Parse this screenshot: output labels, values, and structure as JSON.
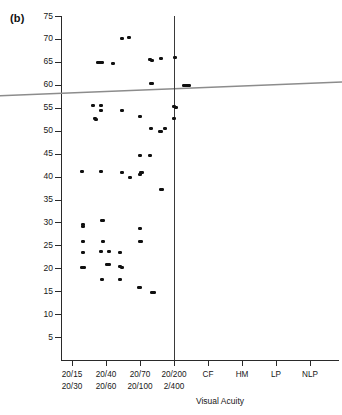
{
  "figure": {
    "panel_label": "(b)"
  },
  "chart_data": {
    "type": "scatter",
    "title": "",
    "xlabel": "Visual Acuity",
    "ylabel": "",
    "ylim": [
      0,
      75
    ],
    "yticks": [
      5,
      10,
      15,
      20,
      25,
      30,
      35,
      40,
      45,
      50,
      55,
      60,
      65,
      70,
      75
    ],
    "ytick_labels": [
      "5",
      "10",
      "15",
      "20",
      "25",
      "30",
      "35",
      "40",
      "45",
      "50",
      "55",
      "60",
      "65",
      "70",
      "75"
    ],
    "grid": false,
    "legend": null,
    "xtick_groups": [
      {
        "index": 0,
        "line1": "20/15",
        "line2": "20/30"
      },
      {
        "index": 1,
        "line1": "20/40",
        "line2": "20/60"
      },
      {
        "index": 2,
        "line1": "20/70",
        "line2": "20/100"
      },
      {
        "index": 3,
        "line1": "20/200",
        "line2": "2/400"
      }
    ],
    "xtick_singles": [
      {
        "index": 4,
        "label": "CF"
      },
      {
        "index": 5,
        "label": "HM"
      },
      {
        "index": 6,
        "label": "LP"
      },
      {
        "index": 7,
        "label": "NLP"
      }
    ],
    "reference_line": {
      "kind": "regression",
      "color": "#8c8c8c",
      "y_at_left_edge": 57.6,
      "y_at_right_edge": 60.6
    },
    "divider_line": {
      "kind": "vertical-divider",
      "color": "#3a3a3a",
      "x_category": "20/200 - 2/400"
    },
    "points": [
      {
        "x": 0.3,
        "y": 41.0
      },
      {
        "x": 0.32,
        "y": 29.6
      },
      {
        "x": 0.32,
        "y": 29.2
      },
      {
        "x": 0.32,
        "y": 25.8
      },
      {
        "x": 0.32,
        "y": 23.5
      },
      {
        "x": 0.3,
        "y": 20.2
      },
      {
        "x": 0.35,
        "y": 20.2
      },
      {
        "x": 0.62,
        "y": 55.5
      },
      {
        "x": 0.67,
        "y": 52.6
      },
      {
        "x": 0.71,
        "y": 52.5
      },
      {
        "x": 0.75,
        "y": 64.8
      },
      {
        "x": 0.8,
        "y": 64.8
      },
      {
        "x": 0.85,
        "y": 64.8
      },
      {
        "x": 0.89,
        "y": 64.8
      },
      {
        "x": 0.86,
        "y": 55.5
      },
      {
        "x": 0.86,
        "y": 54.4
      },
      {
        "x": 0.86,
        "y": 41.1
      },
      {
        "x": 0.88,
        "y": 30.5
      },
      {
        "x": 0.92,
        "y": 30.4
      },
      {
        "x": 0.9,
        "y": 25.8
      },
      {
        "x": 0.86,
        "y": 23.6
      },
      {
        "x": 0.88,
        "y": 17.6
      },
      {
        "x": 1.2,
        "y": 64.7
      },
      {
        "x": 1.08,
        "y": 23.6
      },
      {
        "x": 1.04,
        "y": 20.9
      },
      {
        "x": 1.09,
        "y": 20.8
      },
      {
        "x": 1.48,
        "y": 70.2
      },
      {
        "x": 1.48,
        "y": 54.3
      },
      {
        "x": 1.48,
        "y": 40.8
      },
      {
        "x": 1.42,
        "y": 23.4
      },
      {
        "x": 1.4,
        "y": 20.3
      },
      {
        "x": 1.46,
        "y": 20.2
      },
      {
        "x": 1.41,
        "y": 17.6
      },
      {
        "x": 1.68,
        "y": 70.3
      },
      {
        "x": 1.7,
        "y": 39.9
      },
      {
        "x": 2.0,
        "y": 53.0
      },
      {
        "x": 2.0,
        "y": 44.5
      },
      {
        "x": 2.0,
        "y": 40.4
      },
      {
        "x": 2.02,
        "y": 40.8
      },
      {
        "x": 2.05,
        "y": 40.8
      },
      {
        "x": 2.0,
        "y": 28.7
      },
      {
        "x": 2.0,
        "y": 25.8
      },
      {
        "x": 2.03,
        "y": 25.8
      },
      {
        "x": 1.97,
        "y": 15.8
      },
      {
        "x": 2.01,
        "y": 15.8
      },
      {
        "x": 2.3,
        "y": 65.5
      },
      {
        "x": 2.36,
        "y": 65.4
      },
      {
        "x": 2.32,
        "y": 60.3
      },
      {
        "x": 2.36,
        "y": 60.2
      },
      {
        "x": 2.32,
        "y": 50.4
      },
      {
        "x": 2.3,
        "y": 44.5
      },
      {
        "x": 2.34,
        "y": 14.7
      },
      {
        "x": 2.4,
        "y": 14.7
      },
      {
        "x": 2.62,
        "y": 65.7
      },
      {
        "x": 2.62,
        "y": 37.1
      },
      {
        "x": 2.66,
        "y": 37.1
      },
      {
        "x": 2.58,
        "y": 49.9
      },
      {
        "x": 2.63,
        "y": 49.9
      },
      {
        "x": 2.72,
        "y": 50.4
      },
      {
        "x": 3.02,
        "y": 65.9
      },
      {
        "x": 3.0,
        "y": 55.2
      },
      {
        "x": 3.05,
        "y": 55.1
      },
      {
        "x": 3.0,
        "y": 52.6
      },
      {
        "x": 3.28,
        "y": 59.8
      },
      {
        "x": 3.32,
        "y": 59.8
      },
      {
        "x": 3.36,
        "y": 59.8
      },
      {
        "x": 3.4,
        "y": 59.8
      },
      {
        "x": 3.44,
        "y": 59.8
      }
    ]
  }
}
